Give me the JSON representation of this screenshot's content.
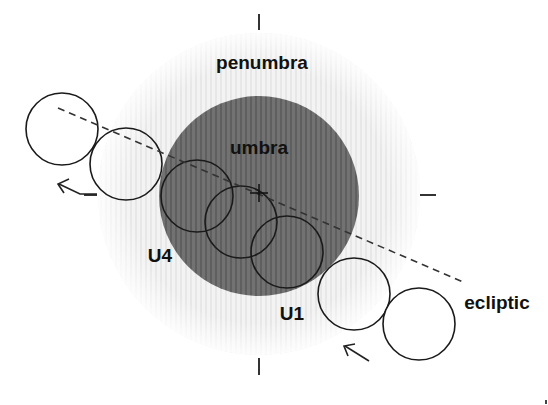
{
  "diagram": {
    "type": "lunar-eclipse-geometry",
    "labels": {
      "penumbra": "penumbra",
      "umbra": "umbra",
      "u4": "U4",
      "u1": "U1",
      "ecliptic": "ecliptic"
    },
    "colors": {
      "background": "#ffffff",
      "penumbra": "#f2f2f2",
      "penumbra_stripe": "#e6e6e6",
      "umbra": "#6e6e6e",
      "umbra_stripe": "#5e5e5e",
      "line": "#222222"
    },
    "shadow": {
      "center": [
        259,
        194
      ],
      "penumbra_radius": 161,
      "umbra_radius": 100
    },
    "ecliptic_line": {
      "from": [
        58,
        108
      ],
      "to": [
        463,
        282
      ]
    },
    "moon_positions": [
      {
        "cx": 62,
        "cy": 129
      },
      {
        "cx": 126,
        "cy": 164
      },
      {
        "cx": 197,
        "cy": 196
      },
      {
        "cx": 241,
        "cy": 222
      },
      {
        "cx": 287,
        "cy": 252
      },
      {
        "cx": 354,
        "cy": 294
      },
      {
        "cx": 419,
        "cy": 324
      }
    ],
    "moon_radius": 36,
    "direction_arrows": [
      {
        "name": "exit-arrow",
        "direction": "up-left"
      },
      {
        "name": "entry-arrow",
        "direction": "up-left"
      }
    ]
  }
}
